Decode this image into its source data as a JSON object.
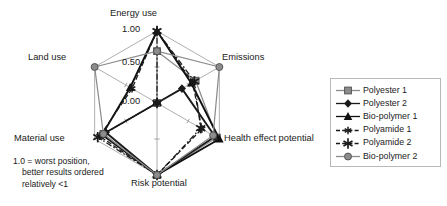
{
  "chart_data": {
    "type": "radar",
    "title": "",
    "note": "1.0 = worst position, better results ordered relatively <1",
    "note_line1": "1.0 = worst position,",
    "note_line2": "better results ordered",
    "note_line3": "relatively <1",
    "categories": [
      "Energy use",
      "Emissions",
      "Health effect potential",
      "Risk potential",
      "Material use",
      "Land use"
    ],
    "tick_labels": [
      "0.00",
      "0.50",
      "1.00"
    ],
    "rlim": [
      0.0,
      1.0
    ],
    "grid": true,
    "legend_position": "right",
    "series": [
      {
        "name": "Polyester 1",
        "marker": "square",
        "marker_color": "#8c8c8c",
        "line_color": "#8c8c8c",
        "line_style": "solid",
        "values": [
          0.72,
          0.62,
          0.96,
          1.0,
          0.86,
          0.0
        ]
      },
      {
        "name": "Polyester 2",
        "marker": "diamond",
        "marker_color": "#1a1a1a",
        "line_color": "#1a1a1a",
        "line_style": "solid",
        "values": [
          0.0,
          0.4,
          0.93,
          1.0,
          0.82,
          0.0
        ]
      },
      {
        "name": "Bio-polymer 1",
        "marker": "triangle",
        "marker_color": "#111111",
        "line_color": "#111111",
        "line_style": "solid",
        "values": [
          1.0,
          0.55,
          1.0,
          1.0,
          0.88,
          0.43
        ]
      },
      {
        "name": "Polyamide 1",
        "marker": "star-small",
        "marker_color": "#1a1a1a",
        "line_color": "#1a1a1a",
        "line_style": "dashed",
        "values": [
          1.0,
          0.57,
          0.72,
          1.0,
          0.92,
          0.4
        ]
      },
      {
        "name": "Polyamide 2",
        "marker": "star-large",
        "marker_color": "#1a1a1a",
        "line_color": "#1a1a1a",
        "line_style": "dashdot",
        "values": [
          1.0,
          0.6,
          0.7,
          1.0,
          0.95,
          0.0
        ]
      },
      {
        "name": "Bio-polymer 2",
        "marker": "circle",
        "marker_color": "#8c8c8c",
        "line_color": "#8c8c8c",
        "line_style": "solid",
        "values": [
          0.72,
          1.0,
          0.9,
          1.0,
          0.86,
          1.0
        ]
      }
    ]
  },
  "axis_titles": {
    "energy_use": "Energy use",
    "emissions": "Emissions",
    "health_effect_potential": "Health effect potential",
    "risk_potential": "Risk potential",
    "material_use": "Material use",
    "land_use": "Land use"
  },
  "ticks": {
    "zero": "0.00",
    "half": "0.50",
    "one": "1.00"
  },
  "legend": {
    "items": [
      {
        "label": "Polyester 1"
      },
      {
        "label": "Polyester 2"
      },
      {
        "label": "Bio-polymer 1"
      },
      {
        "label": "Polyamide 1"
      },
      {
        "label": "Polyamide 2"
      },
      {
        "label": "Bio-polymer 2"
      }
    ]
  },
  "colors": {
    "gray": "#8c8c8c",
    "black": "#1a1a1a",
    "grid": "#9a9a9a",
    "legend_border": "#b9b9b9"
  }
}
